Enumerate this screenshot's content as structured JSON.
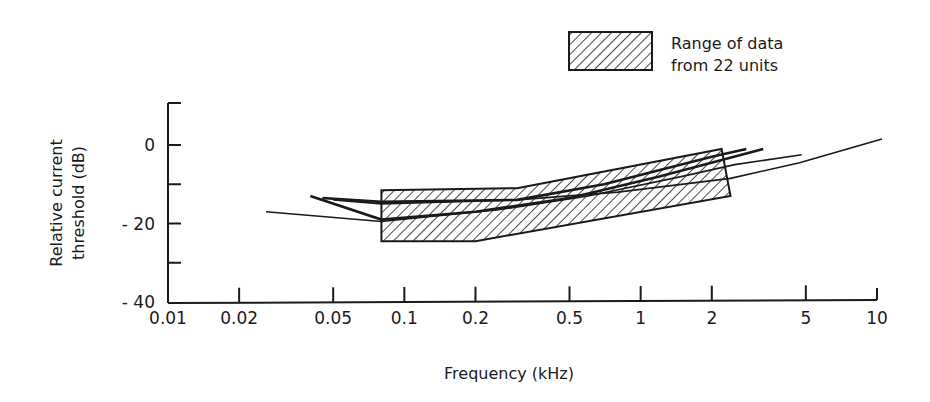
{
  "chart_data": {
    "type": "line",
    "title": "",
    "xlabel": "Frequency (kHz)",
    "ylabel": "Relative current threshold (dB)",
    "ylabel_lines": [
      "Relative current",
      "threshold (dB)"
    ],
    "xscale": "log",
    "xlim": [
      0.01,
      10
    ],
    "ylim": [
      -40,
      10
    ],
    "x_ticks": [
      0.01,
      0.02,
      0.05,
      0.1,
      0.2,
      0.5,
      1,
      2,
      5,
      10
    ],
    "x_tick_labels": [
      "0.01",
      "0.02",
      "0.05",
      "0.1",
      "0.2",
      "0.5",
      "1",
      "2",
      "5",
      "10"
    ],
    "y_ticks": [
      0,
      -10,
      -20,
      -30,
      -40
    ],
    "y_tick_labels": [
      "0",
      "",
      "-20",
      "",
      "-40"
    ],
    "grid": false,
    "legend": {
      "position": "top-right",
      "entries": [
        {
          "label_lines": [
            "Range of data",
            "from 22 units"
          ],
          "style": "hatched-area"
        }
      ]
    },
    "range_band": {
      "name": "Range of data from 22 units",
      "upper": {
        "x": [
          0.08,
          0.3,
          2.2
        ],
        "y": [
          -11.5,
          -11,
          -1
        ]
      },
      "lower": {
        "x": [
          0.08,
          0.2,
          2.4
        ],
        "y": [
          -24.5,
          -24.5,
          -13
        ]
      }
    },
    "series": [
      {
        "name": "unit-1",
        "x": [
          0.045,
          0.08,
          0.3,
          0.7,
          2.0,
          2.8
        ],
        "y": [
          -13.5,
          -14.5,
          -14,
          -10,
          -3,
          -1
        ]
      },
      {
        "name": "unit-2",
        "x": [
          0.04,
          0.08,
          0.2,
          0.5,
          1.2,
          3.3
        ],
        "y": [
          -13,
          -19,
          -17,
          -13.5,
          -8,
          -1
        ]
      },
      {
        "name": "unit-3",
        "x": [
          0.026,
          0.08,
          0.25,
          0.6,
          1.5,
          2.5,
          4.8
        ],
        "y": [
          -17,
          -19.5,
          -16.5,
          -13,
          -8,
          -5,
          -2.5
        ]
      },
      {
        "name": "unit-4",
        "x": [
          0.05,
          0.08,
          0.3,
          0.8,
          2.4,
          4.7,
          10.5
        ],
        "y": [
          -14,
          -15,
          -14,
          -12,
          -8.5,
          -4.5,
          1.5
        ]
      }
    ]
  }
}
